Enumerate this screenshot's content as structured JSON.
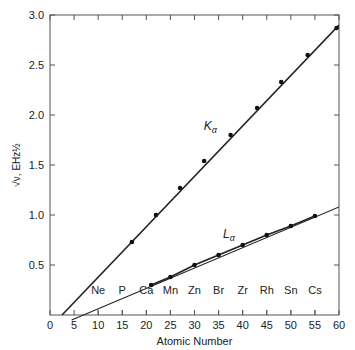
{
  "chart_data": {
    "type": "line",
    "title": "",
    "xlabel": "Atomic Number",
    "ylabel": "√ν, EHz½",
    "xlim": [
      0,
      60
    ],
    "ylim": [
      0,
      3.0
    ],
    "xticks": [
      0,
      5,
      10,
      15,
      20,
      25,
      30,
      35,
      40,
      45,
      50,
      55,
      60
    ],
    "yticks": [
      0.5,
      1.0,
      1.5,
      2.0,
      2.5,
      3.0
    ],
    "ytick_labels": [
      "0.5",
      "1.0",
      "1.5",
      "2.0",
      "2.5",
      "3.0"
    ],
    "grid": false,
    "element_labels": [
      {
        "label": "Ne",
        "x": 10
      },
      {
        "label": "P",
        "x": 15
      },
      {
        "label": "Ca",
        "x": 20
      },
      {
        "label": "Mn",
        "x": 25
      },
      {
        "label": "Zn",
        "x": 30
      },
      {
        "label": "Br",
        "x": 35
      },
      {
        "label": "Zr",
        "x": 40
      },
      {
        "label": "Rh",
        "x": 45
      },
      {
        "label": "Sn",
        "x": 50
      },
      {
        "label": "Cs",
        "x": 55
      }
    ],
    "series": [
      {
        "name": "Kα",
        "line": {
          "x": [
            2.5,
            60
          ],
          "y": [
            0,
            2.9
          ]
        },
        "points": {
          "x": [
            17,
            22,
            27,
            32,
            37.5,
            43,
            48,
            53.5,
            59.5
          ],
          "y": [
            0.73,
            1.0,
            1.27,
            1.54,
            1.8,
            2.07,
            2.33,
            2.6,
            2.87
          ]
        },
        "label_pos": {
          "x": 34,
          "y": 1.85
        }
      },
      {
        "name": "Lα",
        "line": {
          "x": [
            4.5,
            60
          ],
          "y": [
            -0.05,
            1.08
          ]
        },
        "points": {
          "x": [
            21,
            25,
            30,
            35,
            40,
            45,
            50,
            55
          ],
          "y": [
            0.3,
            0.38,
            0.5,
            0.6,
            0.7,
            0.8,
            0.89,
            0.99
          ]
        },
        "label_pos": {
          "x": 38,
          "y": 0.77
        }
      }
    ]
  }
}
